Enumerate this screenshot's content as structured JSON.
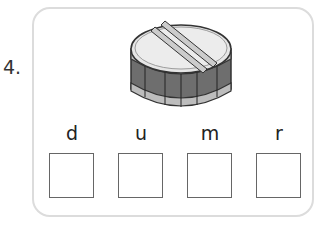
{
  "question": {
    "number": "4."
  },
  "image": {
    "subject": "drum-icon",
    "description": "snare drum with two drumsticks"
  },
  "letters": [
    "d",
    "u",
    "m",
    "r"
  ],
  "answer_boxes": [
    {
      "value": ""
    },
    {
      "value": ""
    },
    {
      "value": ""
    },
    {
      "value": ""
    }
  ]
}
